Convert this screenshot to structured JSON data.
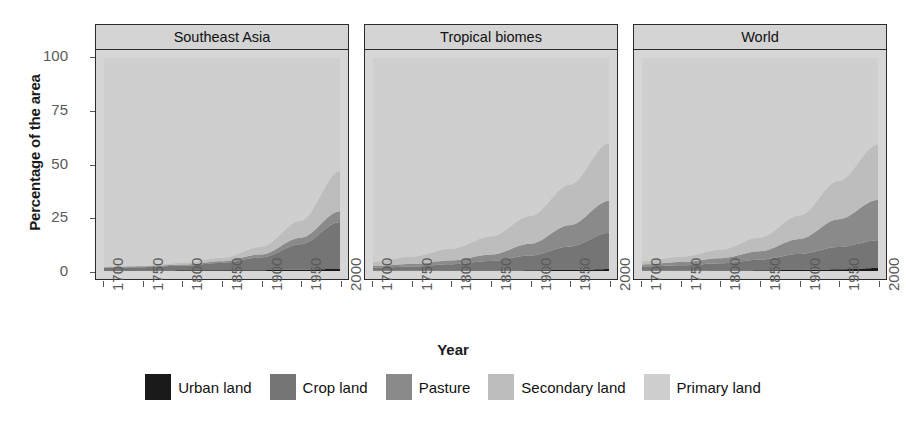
{
  "chart_data": {
    "type": "area",
    "title": "",
    "xlabel": "Year",
    "ylabel": "Percentage of the area",
    "stacked": true,
    "percent": true,
    "xlim": [
      1700,
      2000
    ],
    "ylim": [
      0,
      100
    ],
    "grid": false,
    "legend_position": "bottom",
    "x_ticks": [
      "1700",
      "1750",
      "1800",
      "1850",
      "1900",
      "1950",
      "2000"
    ],
    "y_ticks": [
      "0",
      "25",
      "50",
      "75",
      "100"
    ],
    "x": [
      1700,
      1750,
      1800,
      1850,
      1900,
      1950,
      2000
    ],
    "series_order": [
      "Urban land",
      "Crop land",
      "Pasture",
      "Secondary land",
      "Primary land"
    ],
    "colors": {
      "Urban land": "#1a1a1a",
      "Crop land": "#757575",
      "Pasture": "#8a8a8a",
      "Secondary land": "#bdbdbd",
      "Primary land": "#cfcfcf",
      "panel_background": "#d6d6d6",
      "strip_background": "#d4d4d4",
      "panel_border": "#2b2b2b",
      "tick_text": "#5a5a5a",
      "axis_title": "#1a1a1a"
    },
    "panels": [
      {
        "label": "Southeast Asia",
        "series": [
          {
            "name": "Urban land",
            "values": [
              0.2,
              0.2,
              0.3,
              0.3,
              0.4,
              0.6,
              1.0
            ]
          },
          {
            "name": "Crop land",
            "values": [
              1.3,
              1.6,
              2.2,
              3.5,
              6.0,
              12.0,
              22.0
            ]
          },
          {
            "name": "Pasture",
            "values": [
              0.3,
              0.4,
              0.5,
              0.8,
              1.4,
              3.0,
              5.0
            ]
          },
          {
            "name": "Secondary land",
            "values": [
              0.2,
              0.4,
              0.8,
              1.6,
              3.5,
              8.0,
              19.0
            ]
          },
          {
            "name": "Primary land",
            "values": [
              98.0,
              97.4,
              96.2,
              93.8,
              88.7,
              76.4,
              53.0
            ]
          }
        ]
      },
      {
        "label": "Tropical biomes",
        "series": [
          {
            "name": "Urban land",
            "values": [
              0.1,
              0.1,
              0.2,
              0.2,
              0.3,
              0.5,
              0.9
            ]
          },
          {
            "name": "Crop land",
            "values": [
              1.4,
              2.0,
              3.0,
              4.5,
              7.0,
              11.0,
              17.0
            ]
          },
          {
            "name": "Pasture",
            "values": [
              0.8,
              1.2,
              1.8,
              3.0,
              5.5,
              10.0,
              15.0
            ]
          },
          {
            "name": "Secondary land",
            "values": [
              2.0,
              3.5,
              5.5,
              8.5,
              13.0,
              19.0,
              27.0
            ]
          },
          {
            "name": "Primary land",
            "values": [
              95.7,
              93.2,
              89.5,
              83.8,
              74.2,
              59.5,
              40.1
            ]
          }
        ]
      },
      {
        "label": "World",
        "series": [
          {
            "name": "Urban land",
            "values": [
              0.1,
              0.1,
              0.2,
              0.3,
              0.5,
              0.8,
              1.4
            ]
          },
          {
            "name": "Crop land",
            "values": [
              2.0,
              2.6,
              3.4,
              5.0,
              7.5,
              10.5,
              13.0
            ]
          },
          {
            "name": "Pasture",
            "values": [
              1.0,
              1.5,
              2.4,
              4.0,
              7.0,
              13.0,
              19.0
            ]
          },
          {
            "name": "Secondary land",
            "values": [
              1.5,
              2.5,
              4.0,
              6.5,
              11.0,
              18.0,
              26.0
            ]
          },
          {
            "name": "Primary land",
            "values": [
              95.4,
              93.3,
              90.0,
              84.2,
              74.0,
              57.7,
              40.6
            ]
          }
        ]
      }
    ]
  },
  "legend": {
    "items": [
      {
        "label": "Urban land",
        "color": "#1a1a1a"
      },
      {
        "label": "Crop land",
        "color": "#757575"
      },
      {
        "label": "Pasture",
        "color": "#8a8a8a"
      },
      {
        "label": "Secondary land",
        "color": "#bdbdbd"
      },
      {
        "label": "Primary land",
        "color": "#cfcfcf"
      }
    ]
  },
  "axes": {
    "y_title": "Percentage of the area",
    "x_title": "Year",
    "y_ticks": [
      "100",
      "75",
      "50",
      "25",
      "0"
    ],
    "x_ticks": [
      "1700",
      "1750",
      "1800",
      "1850",
      "1900",
      "1950",
      "2000"
    ]
  },
  "panel_titles": [
    "Southeast Asia",
    "Tropical biomes",
    "World"
  ]
}
